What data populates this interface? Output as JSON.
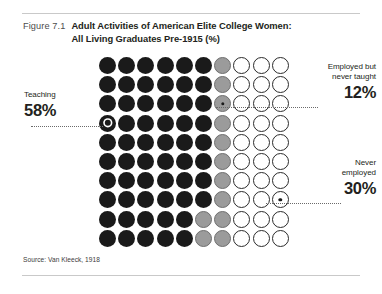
{
  "figure": {
    "number_label": "Figure 7.1",
    "title_line1": "Adult Activities of American Elite College Women:",
    "title_line2": "All Living Graduates Pre-1915 (%)",
    "source": "Source: Van Kleeck, 1918"
  },
  "callouts": {
    "teaching": {
      "caption": "Teaching",
      "value": "58%"
    },
    "employed": {
      "caption_line1": "Employed but",
      "caption_line2": "never taught",
      "value": "12%"
    },
    "never": {
      "caption_line1": "Never",
      "caption_line2": "employed",
      "value": "30%"
    }
  },
  "colors": {
    "black": "#1a1a1a",
    "gray": "#9b9b9b",
    "white": "#ffffff",
    "outline": "#2b2b2b",
    "rule": "#c9c9c9",
    "text": "#231f20",
    "figure_number": "#4d4d4d"
  },
  "chart_data": {
    "type": "pie",
    "subtype": "waffle-dot-matrix",
    "title": "Adult Activities of American Elite College Women: All Living Graduates Pre-1915 (%)",
    "unit": "1 dot = 1 percent",
    "grid": {
      "rows": 10,
      "columns": 10,
      "total_dots": 100
    },
    "categories": [
      "Teaching",
      "Employed but never taught",
      "Never employed"
    ],
    "values": [
      58,
      12,
      30
    ],
    "series": [
      {
        "name": "Teaching",
        "value": 58,
        "color": "#1a1a1a",
        "label": "58%"
      },
      {
        "name": "Employed but never taught",
        "value": 12,
        "color": "#9b9b9b",
        "label": "12%"
      },
      {
        "name": "Never employed",
        "value": 30,
        "color": "#ffffff",
        "label": "30%"
      }
    ],
    "legend_position": "callouts-left-and-right",
    "grid_lines": false,
    "xlabel": "",
    "ylabel": "",
    "rows": [
      {
        "index": 1,
        "cells": [
          "black",
          "black",
          "black",
          "black",
          "black",
          "black",
          "gray",
          "white",
          "white",
          "white"
        ]
      },
      {
        "index": 2,
        "cells": [
          "black",
          "black",
          "black",
          "black",
          "black",
          "black",
          "gray",
          "white",
          "white",
          "white"
        ]
      },
      {
        "index": 3,
        "cells": [
          "black",
          "black",
          "black",
          "black",
          "black",
          "black",
          "gray",
          "white",
          "white",
          "white"
        ]
      },
      {
        "index": 4,
        "cells": [
          "black",
          "black",
          "black",
          "black",
          "black",
          "black",
          "gray",
          "white",
          "white",
          "white"
        ]
      },
      {
        "index": 5,
        "cells": [
          "black",
          "black",
          "black",
          "black",
          "black",
          "black",
          "gray",
          "white",
          "white",
          "white"
        ]
      },
      {
        "index": 6,
        "cells": [
          "black",
          "black",
          "black",
          "black",
          "black",
          "black",
          "gray",
          "white",
          "white",
          "white"
        ]
      },
      {
        "index": 7,
        "cells": [
          "black",
          "black",
          "black",
          "black",
          "black",
          "black",
          "gray",
          "white",
          "white",
          "white"
        ]
      },
      {
        "index": 8,
        "cells": [
          "black",
          "black",
          "black",
          "black",
          "black",
          "black",
          "gray",
          "white",
          "white",
          "white"
        ]
      },
      {
        "index": 9,
        "cells": [
          "black",
          "black",
          "black",
          "black",
          "black",
          "gray",
          "gray",
          "white",
          "white",
          "white"
        ]
      },
      {
        "index": 10,
        "cells": [
          "black",
          "black",
          "black",
          "black",
          "black",
          "gray",
          "gray",
          "white",
          "white",
          "white"
        ]
      }
    ],
    "markers": [
      {
        "row": 4,
        "column": 1,
        "target": "Teaching"
      },
      {
        "row": 3,
        "column": 7,
        "target": "Employed but never taught"
      },
      {
        "row": 8,
        "column": 10,
        "target": "Never employed"
      }
    ]
  }
}
